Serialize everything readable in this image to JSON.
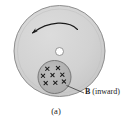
{
  "figure": {
    "caption": "(a)",
    "field_label_symbol": "B",
    "field_label_text": " (inward)",
    "rotation_direction": "counterclockwise",
    "disk_fill_color": "#d2d2d2",
    "disk_edge_color": "#8f8f8f",
    "field_region_fill_color": "#b4b4b4",
    "field_region_edge_color": "#6e6e6e",
    "hole_fill_color": "#ffffff",
    "arrow_color": "#1a1a1a",
    "leader_color": "#3a3a3a",
    "x_mark_count": 8,
    "x_marks": [
      {
        "x": 48,
        "y": 70
      },
      {
        "x": 59,
        "y": 69
      },
      {
        "x": 43,
        "y": 77
      },
      {
        "x": 53,
        "y": 76
      },
      {
        "x": 63,
        "y": 76
      },
      {
        "x": 46,
        "y": 84
      },
      {
        "x": 56,
        "y": 84
      },
      {
        "x": 64,
        "y": 83
      }
    ]
  }
}
